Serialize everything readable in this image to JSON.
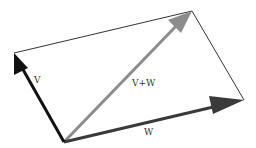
{
  "diagram": {
    "points": {
      "origin": [
        64,
        142
      ],
      "v_tip": [
        14,
        53
      ],
      "w_tip": [
        244,
        100
      ],
      "sum_tip": [
        192,
        11
      ]
    },
    "vectors": [
      {
        "name": "V",
        "label": "V",
        "from": "origin",
        "to": "v_tip",
        "color": "#111111",
        "label_pos": [
          34,
          82
        ]
      },
      {
        "name": "W",
        "label": "W",
        "from": "origin",
        "to": "w_tip",
        "color": "#3a3a3a",
        "label_pos": [
          144,
          135
        ]
      },
      {
        "name": "V+W",
        "label": "V+W",
        "from": "origin",
        "to": "sum_tip",
        "color": "#8c8c8c",
        "label_pos": [
          132,
          86
        ]
      }
    ],
    "edges_color": "#333333"
  },
  "labels": {
    "v": "V",
    "w": "W",
    "sum": "V+W"
  }
}
